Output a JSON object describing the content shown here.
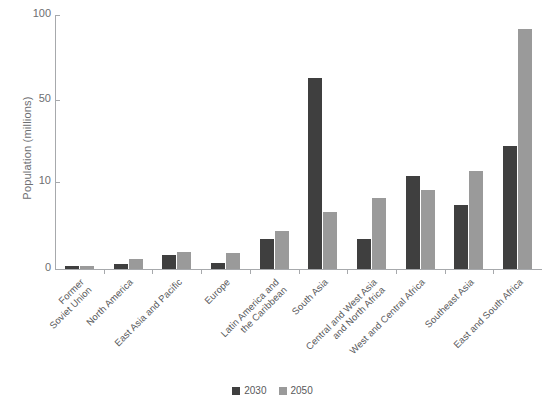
{
  "chart_data": {
    "type": "bar",
    "title": "",
    "subtitle": "",
    "xlabel": "",
    "ylabel": "Population (millions)",
    "grid": false,
    "legend_position": "bottom",
    "axis_scale": "non-linear (compressed upper range)",
    "ylim": [
      0,
      100
    ],
    "ytick_labels": [
      "100",
      "50",
      "10",
      "0"
    ],
    "ytick_values": [
      100,
      50,
      10,
      0
    ],
    "categories": [
      "Former\nSoviet Union",
      "North America",
      "East Asia and Pacific",
      "Europe",
      "Latin America and\nthe Caribbean",
      "South Asia",
      "Central and West Asia\nand North Africa",
      "West and Central Africa",
      "Southeast Asia",
      "East and South Africa"
    ],
    "series": [
      {
        "name": "2030",
        "color": "#3f3f3f",
        "values": [
          0.3,
          0.6,
          1.6,
          0.7,
          3.5,
          63.0,
          3.4,
          13.0,
          7.4,
          27.5
        ]
      },
      {
        "name": "2050",
        "color": "#9a9a9a",
        "values": [
          0.4,
          1.2,
          2.0,
          1.8,
          4.4,
          6.6,
          8.2,
          9.1,
          15.5,
          92.0
        ]
      }
    ]
  },
  "legend": {
    "items": [
      {
        "label": "2030",
        "color": "#3f3f3f"
      },
      {
        "label": "2050",
        "color": "#9a9a9a"
      }
    ]
  },
  "axis": {
    "y_title": "Population (millions)"
  }
}
